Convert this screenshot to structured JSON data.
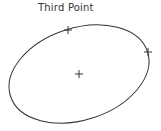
{
  "diagram": {
    "label": "Third Point",
    "stroke_color": "#333333",
    "ellipse": {
      "cx": 79,
      "cy": 74,
      "rx": 72,
      "ry": 46,
      "rotation": -18
    },
    "points": [
      {
        "name": "third-point",
        "x": 68,
        "y": 30
      },
      {
        "name": "second-point",
        "x": 148,
        "y": 52
      },
      {
        "name": "center-point",
        "x": 79,
        "y": 74
      }
    ]
  }
}
